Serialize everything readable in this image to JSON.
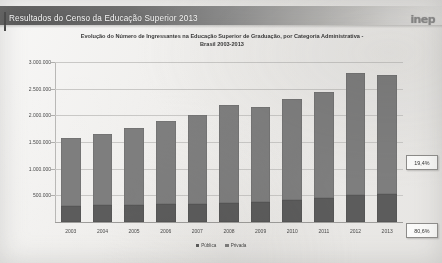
{
  "header": {
    "title": "Resultados do Censo da Educação Superior 2013",
    "logo": "inep"
  },
  "chart_data": {
    "type": "bar",
    "subtype": "stacked-bar",
    "title": "Evolução do Número de Ingressantes na Educação Superior de Graduação, por Categoria Administrativa - Brasil 2003-2013",
    "title_line1": "Evolução do Número de Ingressantes na Educação Superior de Graduação, por Categoria Administrativa -",
    "title_line2": "Brasil 2003-2013",
    "xlabel": "",
    "ylabel": "",
    "categories": [
      "2003",
      "2004",
      "2005",
      "2006",
      "2007",
      "2008",
      "2009",
      "2010",
      "2011",
      "2012",
      "2013"
    ],
    "series": [
      {
        "name": "Pública",
        "color": "#5c5c5c",
        "values": [
          300000,
          310000,
          320000,
          330000,
          340000,
          360000,
          380000,
          420000,
          450000,
          500000,
          530000
        ]
      },
      {
        "name": "Privada",
        "color": "#7e7e7e",
        "values": [
          1280000,
          1340000,
          1450000,
          1560000,
          1660000,
          1830000,
          1770000,
          1880000,
          1980000,
          2300000,
          2230000
        ]
      }
    ],
    "totals": [
      1580000,
      1650000,
      1770000,
      1890000,
      2000000,
      2190000,
      2150000,
      2300000,
      2430000,
      2800000,
      2760000
    ],
    "ylim": [
      0,
      3000000
    ],
    "yticks": [
      0,
      500000,
      1000000,
      1500000,
      2000000,
      2500000,
      3000000
    ],
    "ytick_labels": [
      "",
      "500.000",
      "1.000.000",
      "1.500.000",
      "2.000.000",
      "2.500.000",
      "3.000.000"
    ],
    "grid": true,
    "legend_position": "bottom",
    "legend": [
      "Pública",
      "Privada"
    ],
    "annotations": [
      {
        "name": "share-privada",
        "text": "19,4%",
        "target": "2013"
      },
      {
        "name": "share-publica",
        "text": "80,6%",
        "target": "2013"
      }
    ]
  }
}
